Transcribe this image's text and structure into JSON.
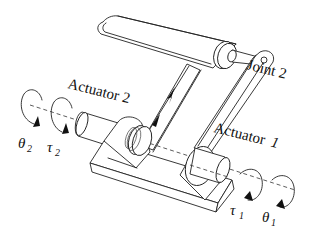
{
  "diagram": {
    "labels": {
      "actuator_2": "Actuator 2",
      "actuator_1_word": "Actuator",
      "actuator_1_num": "1",
      "joint_2": "Joint 2"
    },
    "symbols": {
      "theta_2": {
        "base": "θ",
        "sub": "2"
      },
      "tau_2": {
        "base": "τ",
        "sub": "2"
      },
      "tau_1": {
        "base": "τ",
        "sub": "1"
      },
      "theta_1": {
        "base": "θ",
        "sub": "1"
      }
    },
    "colors": {
      "line": "#222222",
      "background": "#ffffff"
    }
  }
}
